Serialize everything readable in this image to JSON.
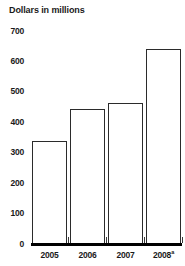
{
  "chart_data": {
    "type": "bar",
    "title": "Dollars in millions",
    "xlabel": "",
    "ylabel": "",
    "categories": [
      "2005",
      "2006",
      "2007",
      "2008"
    ],
    "category_footnotes": [
      "",
      "",
      "",
      "a"
    ],
    "values": [
      340,
      445,
      465,
      640
    ],
    "ylim": [
      0,
      700
    ],
    "ytick_labels": [
      "0",
      "100",
      "200",
      "300",
      "400",
      "500",
      "600",
      "700"
    ],
    "ytick_values": [
      0,
      100,
      200,
      300,
      400,
      500,
      600,
      700
    ],
    "grid": false,
    "legend": null,
    "bar_style": {
      "fill": "#ffffff",
      "outline": "#2b2b2b"
    },
    "axis_color": "#000000"
  },
  "axis": {
    "superscript_marker": "a"
  }
}
